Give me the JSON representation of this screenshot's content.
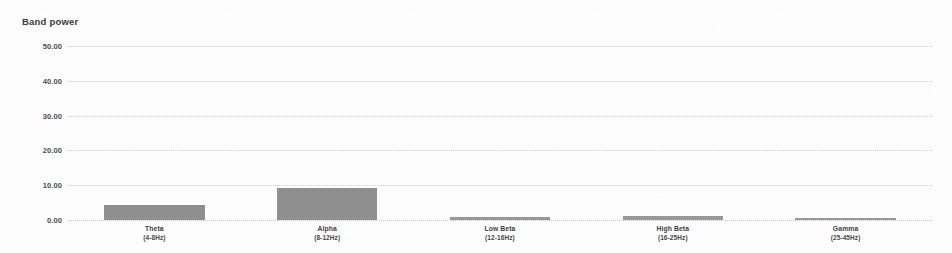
{
  "chart_data": {
    "type": "bar",
    "title": "Band power",
    "xlabel": "",
    "ylabel": "",
    "categories": [
      "Theta",
      "Alpha",
      "Low Beta",
      "High Beta",
      "Gamma"
    ],
    "category_ranges": [
      "(4-8Hz)",
      "(8-12Hz)",
      "(12-16Hz)",
      "(16-25Hz)",
      "(25-45Hz)"
    ],
    "values": [
      4.4,
      9.3,
      1.0,
      1.1,
      0.6
    ],
    "ylim": [
      0,
      50
    ],
    "yticks": [
      0,
      10,
      20,
      30,
      40,
      50
    ],
    "ytick_labels": [
      "0.00",
      "10.00",
      "20.00",
      "30.00",
      "40.00",
      "50.00"
    ],
    "grid": true,
    "legend": "none",
    "bar_color": "#808080"
  }
}
